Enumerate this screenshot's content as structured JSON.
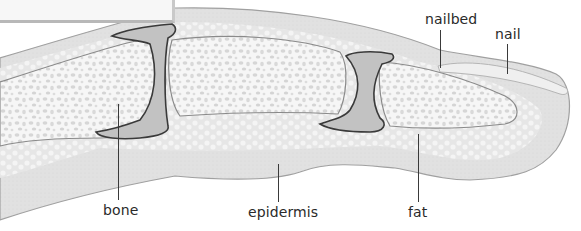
{
  "diagram": {
    "labels": [
      {
        "id": "nailbed",
        "text": "nailbed"
      },
      {
        "id": "nail",
        "text": "nail"
      },
      {
        "id": "bone",
        "text": "bone"
      },
      {
        "id": "epidermis",
        "text": "epidermis"
      },
      {
        "id": "fat",
        "text": "fat"
      }
    ],
    "colors": {
      "skin": "#e2e2e2",
      "skin_edge": "#9a9a9a",
      "fat": "#ececec",
      "bone": "#f6f6f6",
      "bone_pores": "#d2d2d2",
      "joint_capsule": "#bdbdbd",
      "joint_outline": "#3a3a3a",
      "nail": "#eeeeee",
      "text": "#2a2a2a"
    }
  }
}
